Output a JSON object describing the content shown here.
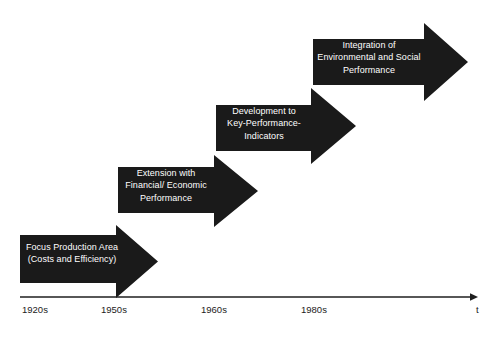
{
  "diagram": {
    "type": "timeline-chevron-progression",
    "title": "",
    "background_color": "#ffffff",
    "arrow_fill_color": "#1a1a1a",
    "arrow_text_color": "#ffffff",
    "axis_color": "#1f1f1f",
    "stages": [
      {
        "id": "stage-1",
        "order": 1,
        "label": "Focus Production Area\n(Costs and Efficiency)",
        "line1": "Focus Production Area",
        "line2": "(Costs and Efficiency)",
        "period": "1920s",
        "body": {
          "x": 20,
          "y": 235,
          "width": 96,
          "height": 48
        },
        "head": {
          "x": 116,
          "y": 225,
          "tip_x": 158,
          "height": 73
        }
      },
      {
        "id": "stage-2",
        "order": 2,
        "label": "Extension with\nFinancial/ Economic\nPerformance",
        "line1": "Extension with",
        "line2": "Financial/ Economic",
        "line3": "Performance",
        "period": "1950s",
        "body": {
          "x": 118,
          "y": 167,
          "width": 96,
          "height": 46
        },
        "head": {
          "x": 214,
          "y": 155,
          "tip_x": 258,
          "height": 72
        }
      },
      {
        "id": "stage-3",
        "order": 3,
        "label": "Development to\nKey-Performance-\nIndicators",
        "line1": "Development to",
        "line2": "Key-Performance-",
        "line3": "Indicators",
        "period": "1960s",
        "body": {
          "x": 216,
          "y": 105,
          "width": 95,
          "height": 46
        },
        "head": {
          "x": 311,
          "y": 88,
          "tip_x": 356,
          "height": 76
        }
      },
      {
        "id": "stage-4",
        "order": 4,
        "label": "Integration of\nEnvironmental and Social\nPerformance",
        "line1": "Integration of",
        "line2": "Environmental and Social",
        "line3": "Performance",
        "period": "1980s",
        "body": {
          "x": 313,
          "y": 39,
          "width": 111,
          "height": 46
        },
        "head": {
          "x": 424,
          "y": 23,
          "tip_x": 468,
          "height": 78
        }
      }
    ]
  },
  "axis": {
    "name": "time-axis",
    "orientation": "horizontal",
    "start_x": 20,
    "end_x": 478,
    "y": 297,
    "variable_label": "t",
    "ticks": [
      {
        "label": "1920s",
        "x": 22
      },
      {
        "label": "1950s",
        "x": 101
      },
      {
        "label": "1960s",
        "x": 201
      },
      {
        "label": "1980s",
        "x": 301
      }
    ]
  }
}
